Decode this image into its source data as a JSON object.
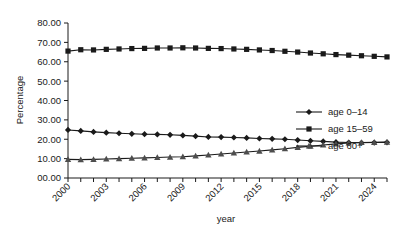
{
  "chart_data": {
    "type": "line",
    "title": "",
    "xlabel": "year",
    "ylabel": "Percentage",
    "xlim": [
      2000,
      2025
    ],
    "ylim": [
      0,
      80
    ],
    "ytick_labels": [
      "00.00",
      "10.00",
      "20.00",
      "30.00",
      "40.00",
      "50.00",
      "60.00",
      "70.00",
      "80.00"
    ],
    "ytick_values": [
      0,
      10,
      20,
      30,
      40,
      50,
      60,
      70,
      80
    ],
    "xtick_labels": [
      "2000",
      "2003",
      "2006",
      "2009",
      "2012",
      "2015",
      "2018",
      "2021",
      "2024"
    ],
    "xtick_values": [
      2000,
      2003,
      2006,
      2009,
      2012,
      2015,
      2018,
      2021,
      2024
    ],
    "minor_xticks_every": 1,
    "grid": false,
    "legend_position": "right-upper",
    "x": [
      2000,
      2001,
      2002,
      2003,
      2004,
      2005,
      2006,
      2007,
      2008,
      2009,
      2010,
      2011,
      2012,
      2013,
      2014,
      2015,
      2016,
      2017,
      2018,
      2019,
      2020,
      2021,
      2022,
      2023,
      2024,
      2025
    ],
    "series": [
      {
        "name": "age 0–14",
        "marker": "diamond",
        "values": [
          24.8,
          24.3,
          23.8,
          23.4,
          23.1,
          22.8,
          22.6,
          22.5,
          22.3,
          22.0,
          21.6,
          21.2,
          21.1,
          20.9,
          20.7,
          20.4,
          20.2,
          20.0,
          19.6,
          19.2,
          18.9,
          18.5,
          18.3,
          18.2,
          18.3,
          18.4
        ]
      },
      {
        "name": "age 15–59",
        "marker": "square",
        "values": [
          65.5,
          66.2,
          66.1,
          66.4,
          66.6,
          66.8,
          66.9,
          67.1,
          67.1,
          67.2,
          67.1,
          66.9,
          66.8,
          66.6,
          66.4,
          66.1,
          65.8,
          65.4,
          65.0,
          64.5,
          64.1,
          63.7,
          63.4,
          63.1,
          62.8,
          62.5
        ]
      },
      {
        "name": "age  60+",
        "marker": "triangle",
        "values": [
          9.6,
          9.5,
          9.6,
          9.8,
          10.0,
          10.2,
          10.4,
          10.6,
          10.8,
          11.0,
          11.4,
          11.9,
          12.4,
          12.9,
          13.4,
          13.9,
          14.5,
          15.1,
          15.8,
          16.4,
          17.0,
          17.6,
          18.1,
          18.3,
          18.4,
          18.5
        ]
      }
    ]
  },
  "axes": {
    "y_title": "Percentage",
    "x_title": "year"
  },
  "legend": {
    "items": [
      {
        "label": "age 0–14"
      },
      {
        "label": "age 15–59"
      },
      {
        "label": "age  60+"
      }
    ]
  },
  "colors": {
    "ink": "#1a1a1a",
    "background": "#ffffff"
  }
}
